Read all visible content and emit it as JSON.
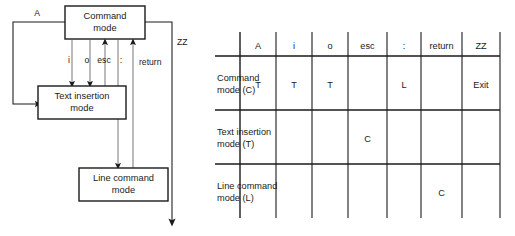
{
  "diagram": {
    "states": [
      {
        "id": "command",
        "line1": "Command",
        "line2": "mode"
      },
      {
        "id": "text-insertion",
        "line1": "Text insertion",
        "line2": "mode"
      },
      {
        "id": "line-command",
        "line1": "Line command",
        "line2": "mode"
      }
    ],
    "edge_labels": {
      "a": "A",
      "i": "i",
      "o": "o",
      "esc": "esc",
      "colon": ":",
      "return": "return",
      "zz": "ZZ"
    }
  },
  "table": {
    "corner_label": "",
    "columns": [
      "A",
      "i",
      "o",
      "esc",
      ":",
      "return",
      "ZZ"
    ],
    "rows": [
      {
        "label_line1": "Command",
        "label_line2": "mode (C)",
        "cells": [
          "T",
          "T",
          "T",
          "",
          "L",
          "",
          "Exit"
        ]
      },
      {
        "label_line1": "Text insertion",
        "label_line2": "mode (T)",
        "cells": [
          "",
          "",
          "",
          "C",
          "",
          "",
          ""
        ]
      },
      {
        "label_line1": "Line command",
        "label_line2": "mode (L)",
        "cells": [
          "",
          "",
          "",
          "",
          "",
          "C",
          ""
        ]
      }
    ]
  },
  "colors": {
    "stroke": "#1a1a1a",
    "thin_stroke": "#555555",
    "background": "#ffffff",
    "text": "#1a1a1a"
  }
}
